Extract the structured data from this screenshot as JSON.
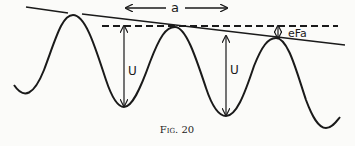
{
  "figure": {
    "caption": "Fig. 20",
    "labels": {
      "period": "a",
      "barrier_left": "U",
      "barrier_right": "U",
      "field_drop": "eFa"
    }
  },
  "colors": {
    "ink": "#1a1a1a",
    "background": "#fbfbf9"
  }
}
